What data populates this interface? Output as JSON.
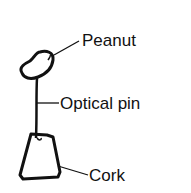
{
  "diagram": {
    "labels": {
      "peanut": "Peanut",
      "pin": "Optical pin",
      "cork": "Cork"
    },
    "colors": {
      "stroke": "#111111",
      "background": "#ffffff"
    }
  }
}
